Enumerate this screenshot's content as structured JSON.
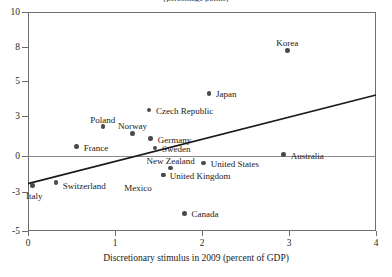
{
  "chart_data": {
    "type": "scatter",
    "title": "(percentage points)",
    "xlabel": "Discretionary stimulus in 2009 (percent of GDP)",
    "ylabel": "",
    "xlim": [
      0,
      4
    ],
    "ylim": [
      -5,
      10
    ],
    "xticks": [
      0,
      1,
      2,
      3,
      4
    ],
    "yticks": [
      10,
      8,
      5,
      3,
      0,
      -3,
      -5
    ],
    "grid": false,
    "legend": "none",
    "zero_line": true,
    "points": [
      {
        "label": "Korea",
        "x": 2.98,
        "y": 7.7
      },
      {
        "label": "Japan",
        "x": 2.08,
        "y": 4.3
      },
      {
        "label": "Czech Republic",
        "x": 1.39,
        "y": 3.35
      },
      {
        "label": "Poland",
        "x": 0.86,
        "y": 2.2
      },
      {
        "label": "Norway",
        "x": 1.2,
        "y": 1.7
      },
      {
        "label": "Germany",
        "x": 1.41,
        "y": 1.3
      },
      {
        "label": "France",
        "x": 0.56,
        "y": 0.7
      },
      {
        "label": "Sweden",
        "x": 1.46,
        "y": 0.6
      },
      {
        "label": "Australia",
        "x": 2.94,
        "y": 0.1
      },
      {
        "label": "United States",
        "x": 2.02,
        "y": -0.6
      },
      {
        "label": "New Zealand",
        "x": 1.64,
        "y": -1.0
      },
      {
        "label": "United Kingdom",
        "x": 1.55,
        "y": -1.6
      },
      {
        "label": "Mexico",
        "x": 1.56,
        "y": -1.6
      },
      {
        "label": "Switzerland",
        "x": 0.32,
        "y": -2.2
      },
      {
        "label": "Italy",
        "x": 0.05,
        "y": -2.45
      },
      {
        "label": "Canada",
        "x": 1.8,
        "y": -4.1
      }
    ],
    "trendline": {
      "x0": 0.0,
      "y0": -2.3,
      "x1": 4.0,
      "y1": 4.2
    }
  },
  "axis": {
    "y_tick_labels": [
      "10",
      "8",
      "5",
      "3",
      "0",
      "-3",
      "-5"
    ],
    "x_tick_labels": [
      "0",
      "1",
      "2",
      "3",
      "4"
    ]
  },
  "labels": {
    "korea": "Korea",
    "japan": "Japan",
    "czech_republic": "Czech Republic",
    "poland": "Poland",
    "norway": "Norway",
    "germany": "Germany",
    "france": "France",
    "sweden": "Sweden",
    "australia": "Australia",
    "united_states": "United States",
    "new_zealand": "New Zealand",
    "united_kingdom": "United Kingdom",
    "mexico": "Mexico",
    "switzerland": "Switzerland",
    "italy": "Italy",
    "canada": "Canada"
  },
  "colors": {
    "marker": "#4a4a4a",
    "frame": "#6e6e6e",
    "trend": "#1a1a1a",
    "text": "#1a1a1a"
  }
}
